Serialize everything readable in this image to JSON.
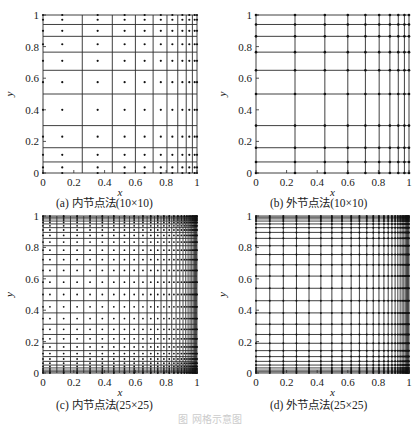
{
  "figure_caption": "图 网格示意图",
  "chart_data": [
    {
      "id": "a",
      "type": "scatter",
      "caption": "(a) 内节点法(10×10)",
      "xlabel": "x",
      "ylabel": "y",
      "xlim": [
        0,
        1
      ],
      "ylim": [
        0,
        1
      ],
      "xticks": [
        "0",
        "0.2",
        "0.4",
        "0.6",
        "0.8",
        "1"
      ],
      "yticks": [
        "0",
        "0.2",
        "0.4",
        "0.6",
        "0.8",
        "1"
      ],
      "method": "interior",
      "grid_lines_x": [
        0,
        0.255,
        0.45,
        0.6,
        0.715,
        0.805,
        0.875,
        0.93,
        0.97,
        1
      ],
      "grid_lines_y": [
        0,
        0.07,
        0.16,
        0.3,
        0.5,
        0.65,
        0.765,
        0.865,
        0.94,
        1
      ],
      "nodes_x": [
        0,
        0.125,
        0.355,
        0.53,
        0.66,
        0.765,
        0.84,
        0.905,
        0.95,
        0.985,
        1
      ],
      "nodes_y": [
        0,
        0.035,
        0.115,
        0.23,
        0.4,
        0.575,
        0.71,
        0.815,
        0.9,
        0.97,
        1
      ]
    },
    {
      "id": "b",
      "type": "scatter",
      "caption": "(b) 外节点法(10×10)",
      "xlabel": "x",
      "ylabel": "y",
      "xlim": [
        0,
        1
      ],
      "ylim": [
        0,
        1
      ],
      "xticks": [
        "0",
        "0.2",
        "0.4",
        "0.6",
        "0.8",
        "1"
      ],
      "yticks": [
        "0",
        "0.2",
        "0.4",
        "0.6",
        "0.8",
        "1"
      ],
      "method": "exterior",
      "grid_lines_x": [
        0,
        0.255,
        0.45,
        0.6,
        0.715,
        0.805,
        0.875,
        0.93,
        0.97,
        1
      ],
      "grid_lines_y": [
        0,
        0.07,
        0.16,
        0.3,
        0.5,
        0.65,
        0.765,
        0.865,
        0.94,
        1
      ]
    },
    {
      "id": "c",
      "type": "scatter",
      "caption": "(c) 内节点法(25×25)",
      "xlabel": "x",
      "ylabel": "y",
      "xlim": [
        0,
        1
      ],
      "ylim": [
        0,
        1
      ],
      "xticks": [
        "0",
        "0.2",
        "0.4",
        "0.6",
        "0.8",
        "1"
      ],
      "yticks": [
        "0",
        "0.2",
        "0.4",
        "0.6",
        "0.8",
        "1"
      ],
      "method": "interior",
      "n": 25,
      "x_stretch": "one-sided-toward-1",
      "y_stretch": "two-sided"
    },
    {
      "id": "d",
      "type": "scatter",
      "caption": "(d) 外节点法(25×25)",
      "xlabel": "x",
      "ylabel": "y",
      "xlim": [
        0,
        1
      ],
      "ylim": [
        0,
        1
      ],
      "xticks": [
        "0",
        "0.2",
        "0.4",
        "0.6",
        "0.8",
        "1"
      ],
      "yticks": [
        "0",
        "0.2",
        "0.4",
        "0.6",
        "0.8",
        "1"
      ],
      "method": "exterior",
      "n": 25,
      "x_stretch": "one-sided-toward-1",
      "y_stretch": "two-sided"
    }
  ],
  "layout": {
    "panels": [
      {
        "id": "a",
        "left": 43,
        "top": 15,
        "right": 197,
        "bottom": 173,
        "caption_x": 56,
        "caption_y": 188
      },
      {
        "id": "b",
        "left": 256,
        "top": 15,
        "right": 409,
        "bottom": 173,
        "caption_x": 270,
        "caption_y": 188
      },
      {
        "id": "c",
        "left": 43,
        "top": 216,
        "right": 197,
        "bottom": 373,
        "caption_x": 56,
        "caption_y": 390
      },
      {
        "id": "d",
        "left": 256,
        "top": 216,
        "right": 409,
        "bottom": 373,
        "caption_x": 270,
        "caption_y": 390
      }
    ],
    "line_color": "#2a2a2a",
    "dot_color": "#111111"
  }
}
